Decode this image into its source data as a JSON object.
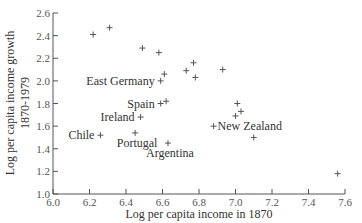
{
  "chart_data": {
    "type": "scatter",
    "title": "",
    "xlabel": "Log per capita income in 1870",
    "ylabel": "Log per capita income growth 1870-1979",
    "ylabel_lines": [
      "Log per capita income growth",
      "1870-1979"
    ],
    "xlim": [
      6.0,
      7.6
    ],
    "ylim": [
      1.0,
      2.6
    ],
    "x_ticks": [
      "6.0",
      "6.2",
      "6.4",
      "6.6",
      "6.8",
      "7.0",
      "7.2",
      "7.4",
      "7.6"
    ],
    "y_ticks": [
      "1.0",
      "1.2",
      "1.4",
      "1.6",
      "1.8",
      "2.0",
      "2.2",
      "2.4",
      "2.6"
    ],
    "grid": false,
    "legend": null,
    "marker": "+",
    "points": [
      {
        "x": 6.22,
        "y": 2.41,
        "label": ""
      },
      {
        "x": 6.31,
        "y": 2.47,
        "label": ""
      },
      {
        "x": 6.49,
        "y": 2.29,
        "label": ""
      },
      {
        "x": 6.58,
        "y": 2.25,
        "label": ""
      },
      {
        "x": 6.77,
        "y": 2.16,
        "label": ""
      },
      {
        "x": 6.73,
        "y": 2.09,
        "label": ""
      },
      {
        "x": 6.78,
        "y": 2.03,
        "label": ""
      },
      {
        "x": 6.93,
        "y": 2.1,
        "label": ""
      },
      {
        "x": 6.61,
        "y": 2.06,
        "label": ""
      },
      {
        "x": 6.59,
        "y": 2.0,
        "label": "East Germany"
      },
      {
        "x": 6.62,
        "y": 1.82,
        "label": ""
      },
      {
        "x": 6.59,
        "y": 1.8,
        "label": "Spain"
      },
      {
        "x": 6.48,
        "y": 1.68,
        "label": "Ireland"
      },
      {
        "x": 6.26,
        "y": 1.52,
        "label": "Chile"
      },
      {
        "x": 6.45,
        "y": 1.54,
        "label": "Portugal"
      },
      {
        "x": 6.63,
        "y": 1.45,
        "label": "Argentina"
      },
      {
        "x": 7.01,
        "y": 1.8,
        "label": ""
      },
      {
        "x": 7.03,
        "y": 1.73,
        "label": ""
      },
      {
        "x": 7.0,
        "y": 1.69,
        "label": ""
      },
      {
        "x": 6.88,
        "y": 1.6,
        "label": "New Zealand"
      },
      {
        "x": 7.1,
        "y": 1.5,
        "label": ""
      },
      {
        "x": 7.56,
        "y": 1.18,
        "label": ""
      }
    ],
    "annotations": [
      {
        "text": "East Germany",
        "x": 6.59,
        "y": 2.0,
        "position": "left"
      },
      {
        "text": "Spain",
        "x": 6.59,
        "y": 1.8,
        "position": "left"
      },
      {
        "text": "Ireland",
        "x": 6.48,
        "y": 1.68,
        "position": "left"
      },
      {
        "text": "Chile",
        "x": 6.26,
        "y": 1.52,
        "position": "left"
      },
      {
        "text": "Portugal",
        "x": 6.45,
        "y": 1.54,
        "position": "below"
      },
      {
        "text": "Argentina",
        "x": 6.63,
        "y": 1.45,
        "position": "below"
      },
      {
        "text": "New Zealand",
        "x": 6.88,
        "y": 1.6,
        "position": "right"
      }
    ]
  },
  "layout": {
    "plot_left": 53,
    "plot_right": 345,
    "plot_top": 13,
    "plot_bottom": 194,
    "axis_color": "#555555",
    "marker_color": "#555555",
    "text_color": "#333333"
  }
}
